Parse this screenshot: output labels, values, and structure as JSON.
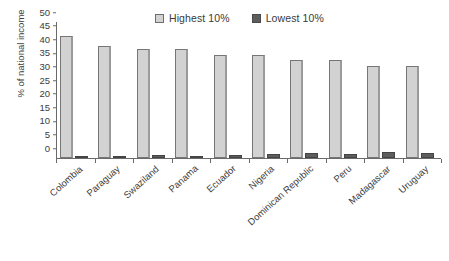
{
  "chart_data": {
    "type": "bar",
    "title": "",
    "xlabel": "",
    "ylabel": "% of national income",
    "ylim": [
      0,
      50
    ],
    "yticks": [
      0,
      5,
      10,
      15,
      20,
      25,
      30,
      35,
      40,
      45,
      50
    ],
    "grid": false,
    "legend_position": "top-center",
    "categories": [
      "Colombia",
      "Paraguay",
      "Swaziland",
      "Panama",
      "Ecuador",
      "Nigeria",
      "Dominican Republic",
      "Peru",
      "Madagascar",
      "Uruguay"
    ],
    "series": [
      {
        "name": "Highest 10%",
        "color": "#d2d2d2",
        "values": [
          45,
          41,
          40,
          40,
          38,
          38,
          36,
          36,
          34,
          34
        ]
      },
      {
        "name": "Lowest 10%",
        "color": "#5e5e5e",
        "values": [
          0.8,
          0.8,
          1.1,
          0.9,
          1.1,
          1.4,
          1.7,
          1.4,
          2.1,
          2.0
        ]
      }
    ]
  },
  "legend": {
    "items": [
      {
        "label": "Highest 10%",
        "swatch": "light-gray-square"
      },
      {
        "label": "Lowest 10%",
        "swatch": "dark-gray-square"
      }
    ]
  }
}
